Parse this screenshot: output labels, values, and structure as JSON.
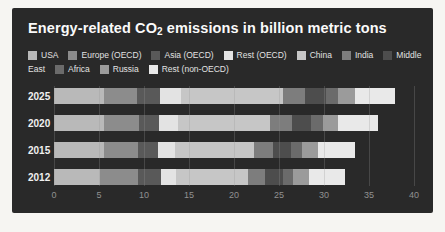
{
  "panel": {
    "background": "#292929"
  },
  "title": {
    "prefix": "Energy-related CO",
    "sub": "2",
    "suffix": " emissions in billion metric tons"
  },
  "legend": {
    "rows": [
      [
        {
          "label": "USA",
          "color": "#b9b9b9"
        },
        {
          "label": "Europe (OECD)",
          "color": "#8c8c8c"
        },
        {
          "label": "Asia (OECD)",
          "color": "#595959"
        },
        {
          "label": "Rest (OECD)",
          "color": "#e3e3e3"
        },
        {
          "label": "China",
          "color": "#c6c6c6"
        },
        {
          "label": "India",
          "color": "#7d7d7d"
        },
        {
          "label": "Middle",
          "color": "#4d4d4d"
        }
      ],
      [
        {
          "label": "East",
          "color": null
        },
        {
          "label": "Africa",
          "color": "#6b6b6b"
        },
        {
          "label": "Russia",
          "color": "#9b9b9b"
        },
        {
          "label": "Rest (non-OECD)",
          "color": "#e9e9e9"
        }
      ]
    ]
  },
  "chart_data": {
    "type": "bar",
    "orientation": "horizontal",
    "stacked": true,
    "title": "Energy-related CO2 emissions in billion metric tons",
    "categories": [
      "2025",
      "2020",
      "2015",
      "2012"
    ],
    "series": [
      {
        "name": "USA",
        "color": "#b9b9b9",
        "values": [
          5.5,
          5.5,
          5.5,
          5.1
        ]
      },
      {
        "name": "Europe (OECD)",
        "color": "#8c8c8c",
        "values": [
          3.7,
          3.9,
          3.8,
          4.2
        ]
      },
      {
        "name": "Asia (OECD)",
        "color": "#595959",
        "values": [
          2.6,
          2.3,
          2.3,
          2.6
        ]
      },
      {
        "name": "Rest (OECD)",
        "color": "#e3e3e3",
        "values": [
          2.3,
          2.1,
          1.9,
          1.7
        ]
      },
      {
        "name": "China",
        "color": "#c6c6c6",
        "values": [
          11.3,
          10.2,
          8.7,
          8.0
        ]
      },
      {
        "name": "India",
        "color": "#7d7d7d",
        "values": [
          2.5,
          2.4,
          2.1,
          1.9
        ]
      },
      {
        "name": "Middle East",
        "color": "#4d4d4d",
        "values": [
          2.3,
          2.2,
          2.0,
          1.9
        ]
      },
      {
        "name": "Africa",
        "color": "#6b6b6b",
        "values": [
          1.4,
          1.3,
          1.3,
          1.2
        ]
      },
      {
        "name": "Russia",
        "color": "#9b9b9b",
        "values": [
          1.8,
          1.7,
          1.7,
          1.7
        ]
      },
      {
        "name": "Rest (non-OECD)",
        "color": "#e9e9e9",
        "values": [
          4.5,
          4.4,
          4.2,
          4.0
        ]
      }
    ],
    "totals": [
      37.9,
      36.0,
      33.5,
      32.3
    ],
    "xlabel": "",
    "ylabel": "",
    "x_ticks": [
      "0",
      "5",
      "10",
      "15",
      "20",
      "25",
      "30",
      "35",
      "40"
    ],
    "xlim": [
      0,
      40
    ],
    "grid": true,
    "legend_position": "top"
  }
}
